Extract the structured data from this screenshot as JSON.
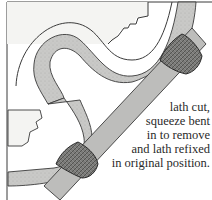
{
  "figure": {
    "caption_lines": [
      "lath cut,",
      "squeeze bent",
      "in to remove",
      "and lath refixed",
      "in original position."
    ]
  },
  "colors": {
    "background": "#ffffff",
    "panel": "#f4f4f2",
    "plaster_band": "#c9c9c7",
    "lath": "#bdbdbb",
    "squeeze": "#6e6e6c",
    "outline": "#3a3a3a",
    "text": "#2a2a2a"
  }
}
